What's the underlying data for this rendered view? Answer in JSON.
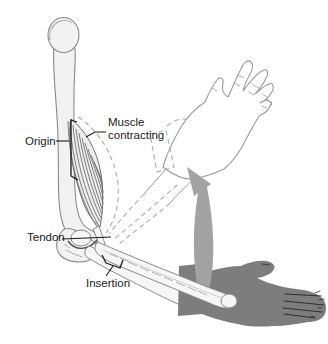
{
  "figure": {
    "labels": {
      "origin": "Origin",
      "muscle_line1": "Muscle",
      "muscle_line2": "contracting",
      "tendon": "Tendon",
      "insertion": "Insertion"
    },
    "colors": {
      "background": "#ffffff",
      "bone_fill": "#f2f2f2",
      "bone_outline": "#8a8a8a",
      "muscle_hatch": "#707070",
      "dashed_outline": "#ababab",
      "arrow": "#a2a2a2",
      "dark_hand": "#7d7d7d",
      "label_text": "#1a1a1a"
    }
  }
}
